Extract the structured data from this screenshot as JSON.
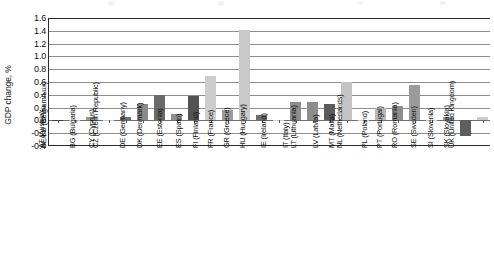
{
  "chart_data": {
    "type": "bar",
    "title": "",
    "subtitle": "",
    "xlabel": "",
    "ylabel": "GDP change, %",
    "ylim": [
      -0.4,
      1.6
    ],
    "ytick_step": 0.2,
    "yticks": [
      "1.6",
      "1.4",
      "1.2",
      "1.0",
      "0.8",
      "0.6",
      "0.4",
      "0.2",
      "0.0",
      "-0.2",
      "-0.4"
    ],
    "ytick_values": [
      1.6,
      1.4,
      1.2,
      1.0,
      0.8,
      0.6,
      0.4,
      0.2,
      0.0,
      -0.2,
      -0.4
    ],
    "grid": true,
    "grid_axis": "y",
    "legend": false,
    "legend_position": "none",
    "categories": [
      "AT (Austria)",
      "BE/LU (Belgium/Lux)",
      "BG (Bulgaria)",
      "CY (Cyprus)",
      "CZ (Czech Republic)",
      "DE (Germany)",
      "DK (Denmark)",
      "EE (Estonia)",
      "ES (Spain)",
      "FI (Finland)",
      "FR (France)",
      "GR (Greece)",
      "HU (Hungary)",
      "IE (Ireland)",
      "IT (Italy)",
      "LT (Lithuania)",
      "LV (Latvia)",
      "MT (Malta)",
      "NL (Netherlands)",
      "PL (Poland)",
      "PT (Portugal)",
      "RO (Romania)",
      "SE (Sweden)",
      "SI (Slovenia)",
      "SK (Slovakia)",
      "UK (United Kingdom)"
    ],
    "values": [
      0.01,
      0.005,
      0.06,
      0.005,
      0.06,
      0.25,
      0.39,
      0.1,
      0.375,
      0.69,
      0.17,
      1.41,
      0.09,
      0.01,
      0.29,
      0.29,
      0.26,
      0.6,
      0.01,
      0.2,
      0.22,
      0.56,
      0.005,
      0.05,
      -0.25,
      0.05
    ],
    "bar_colors": [
      "#3f3f3f",
      "#bdbdbd",
      "#9a9a9a",
      "#cfcfcf",
      "#6e6e6e",
      "#8a8a8a",
      "#6a6a6a",
      "#8e8e8e",
      "#525252",
      "#cdcdcd",
      "#9c9c9c",
      "#c9c9c9",
      "#6b6b6b",
      "#cfcfcf",
      "#8d8d8d",
      "#8d8d8d",
      "#5b5b5b",
      "#c4c4c4",
      "#cfcfcf",
      "#b8b8b8",
      "#8d8d8d",
      "#9b9b9b",
      "#d2d2d2",
      "#9a9a9a",
      "#5e5e5e",
      "#cccccc"
    ]
  },
  "axis": {
    "y_title": "GDP change, %"
  }
}
